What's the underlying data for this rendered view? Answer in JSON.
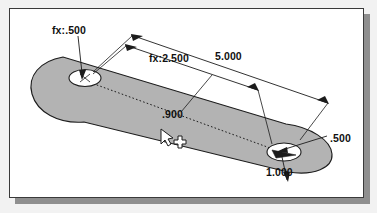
{
  "app": {
    "kind": "cad-sketch-view",
    "sheet_background": "#ffffff",
    "page_background": "#f2f2f2",
    "frame_color": "#3a3a3a",
    "shadow_color": "#8f8f8f"
  },
  "part": {
    "name": "slotted-plate",
    "fill_color": "#b3b3b3",
    "edge_color": "#1c1c1c",
    "hole_fill_color": "#ffffff",
    "centerline_style": "dotted"
  },
  "dimensions": [
    {
      "name": "hole-diameter-left",
      "label": "fx:.500",
      "value": 0.5,
      "driven_by_equation": true
    },
    {
      "name": "hole-spacing",
      "label": "fx:2.500",
      "value": 2.5,
      "driven_by_equation": true
    },
    {
      "name": "overall-length",
      "label": "5.000",
      "value": 5.0,
      "driven_by_equation": false
    },
    {
      "name": "edge-offset",
      "label": ".900",
      "value": 0.9,
      "driven_by_equation": false
    },
    {
      "name": "hole-diameter-right",
      "label": ".500",
      "value": 0.5,
      "driven_by_equation": false
    },
    {
      "name": "slot-width",
      "label": "1.000",
      "value": 1.0,
      "driven_by_equation": false
    }
  ],
  "cursor": {
    "name": "sketch-cursor",
    "pointer": "arrow",
    "modifier": "crosshair-plus",
    "x": 163,
    "y": 133
  }
}
